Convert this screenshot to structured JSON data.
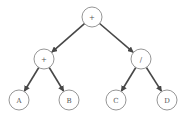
{
  "diagram": {
    "type": "expression-tree",
    "nodes": [
      {
        "id": "root",
        "label": "+",
        "x": 92,
        "y": 17
      },
      {
        "id": "left-op",
        "label": "+",
        "x": 44,
        "y": 59
      },
      {
        "id": "right-op",
        "label": "/",
        "x": 141,
        "y": 59
      },
      {
        "id": "leaf-a",
        "label": "A",
        "x": 19,
        "y": 100
      },
      {
        "id": "leaf-b",
        "label": "B",
        "x": 69,
        "y": 100
      },
      {
        "id": "leaf-c",
        "label": "C",
        "x": 116,
        "y": 100
      },
      {
        "id": "leaf-d",
        "label": "D",
        "x": 167,
        "y": 100
      }
    ],
    "edges": [
      {
        "from": "root",
        "to": "left-op"
      },
      {
        "from": "root",
        "to": "right-op"
      },
      {
        "from": "left-op",
        "to": "leaf-a"
      },
      {
        "from": "left-op",
        "to": "leaf-b"
      },
      {
        "from": "right-op",
        "to": "leaf-c"
      },
      {
        "from": "right-op",
        "to": "leaf-d"
      }
    ],
    "node_radius": 10,
    "colors": {
      "edge": "#474747",
      "node_stroke": "#8a8a8a",
      "label": "#555555"
    }
  }
}
